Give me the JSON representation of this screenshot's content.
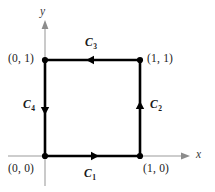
{
  "figure": {
    "type": "vector-diagram",
    "background_color": "#ffffff",
    "width": 215,
    "height": 192
  },
  "axes": {
    "x_label": "x",
    "y_label": "y",
    "axis_color": "#b0b0b0",
    "arrow_color": "#7a7a7a"
  },
  "square": {
    "stroke_color": "#000000",
    "vertex_color": "#000000",
    "orientation": "counterclockwise"
  },
  "vertex_labels": [
    {
      "text": "(0, 0)",
      "point": "origin"
    },
    {
      "text": "(1, 0)",
      "point": "bottom-right"
    },
    {
      "text": "(1, 1)",
      "point": "top-right"
    },
    {
      "text": "(0, 1)",
      "point": "top-left"
    }
  ],
  "curve_labels": [
    {
      "base": "C",
      "sub": "1",
      "edge": "bottom",
      "direction": "right"
    },
    {
      "base": "C",
      "sub": "2",
      "edge": "right",
      "direction": "up"
    },
    {
      "base": "C",
      "sub": "3",
      "edge": "top",
      "direction": "left"
    },
    {
      "base": "C",
      "sub": "4",
      "edge": "left",
      "direction": "down"
    }
  ]
}
